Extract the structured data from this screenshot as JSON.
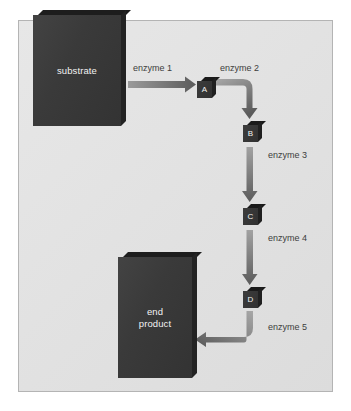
{
  "diagram": {
    "background_color": "#ffffff",
    "panel_color": "#e4e4e4",
    "panel_border_color": "#b4b4b4",
    "box_color": "#3a3a3a",
    "arrow_color": "#5a5a5a",
    "label_color": "#3d3d3d"
  },
  "nodes": {
    "substrate": {
      "label": "substrate",
      "shape": "slab"
    },
    "intermediate_a": {
      "label": "A",
      "shape": "cube"
    },
    "intermediate_b": {
      "label": "B",
      "shape": "cube"
    },
    "intermediate_c": {
      "label": "C",
      "shape": "cube"
    },
    "intermediate_d": {
      "label": "D",
      "shape": "cube"
    },
    "end_product": {
      "label_line1": "end",
      "label_line2": "product",
      "shape": "slab"
    }
  },
  "arrows": [
    {
      "id": "enzyme1",
      "label": "enzyme 1",
      "from": "substrate",
      "to": "intermediate_a",
      "direction": "right"
    },
    {
      "id": "enzyme2",
      "label": "enzyme 2",
      "from": "intermediate_a",
      "to": "intermediate_b",
      "direction": "right-then-down"
    },
    {
      "id": "enzyme3",
      "label": "enzyme 3",
      "from": "intermediate_b",
      "to": "intermediate_c",
      "direction": "down"
    },
    {
      "id": "enzyme4",
      "label": "enzyme 4",
      "from": "intermediate_c",
      "to": "intermediate_d",
      "direction": "down"
    },
    {
      "id": "enzyme5",
      "label": "enzyme 5",
      "from": "intermediate_d",
      "to": "end_product",
      "direction": "down-then-left"
    }
  ]
}
